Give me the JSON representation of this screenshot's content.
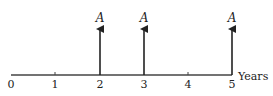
{
  "diagram": {
    "type": "cash-flow-timeline",
    "axis_label": "Years",
    "ticks": [
      "0",
      "1",
      "2",
      "3",
      "4",
      "5"
    ],
    "cash_flows": [
      {
        "period": 2,
        "label": "A",
        "direction": "up"
      },
      {
        "period": 3,
        "label": "A",
        "direction": "up"
      },
      {
        "period": 5,
        "label": "A",
        "direction": "up"
      }
    ],
    "line_color": "#333333"
  }
}
